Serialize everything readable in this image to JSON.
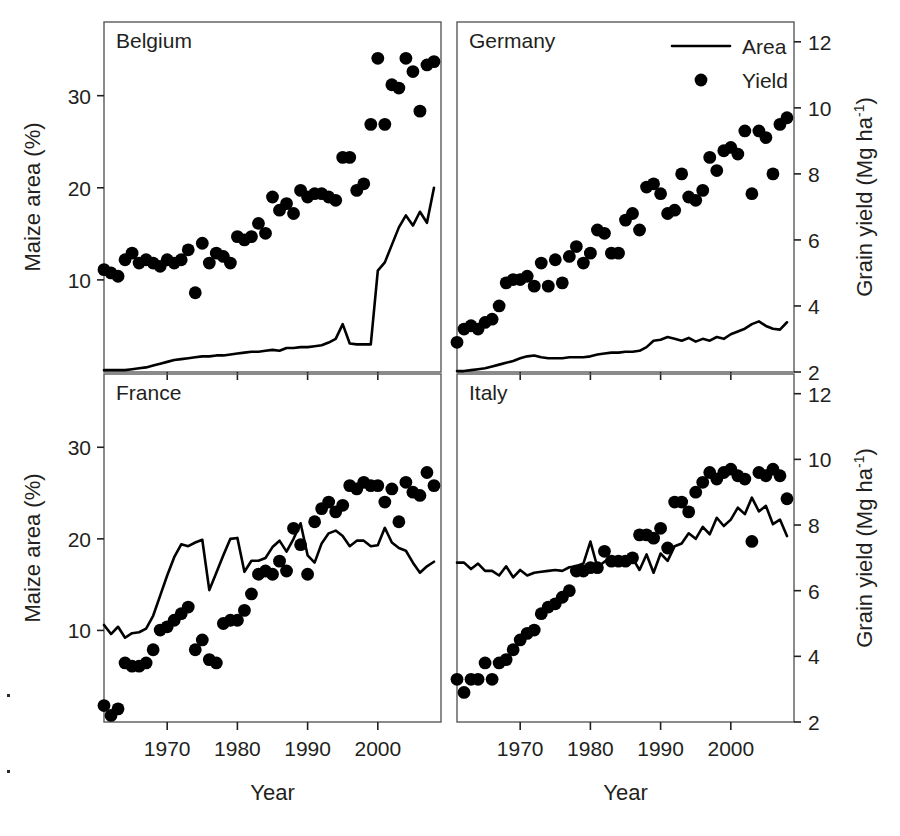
{
  "figure": {
    "left_axis_title": "Maize area (%)",
    "right_axis_title_main": "Grain yield (Mg ha",
    "right_axis_title_sup": "-1",
    "right_axis_title_close": ")",
    "x_axis_title": "Year",
    "legend": {
      "area_label": "Area",
      "yield_label": "Yield"
    },
    "ink_color": "#000000"
  },
  "chart_data": {
    "type": "line",
    "xlabel": "Year",
    "ylabel": "Maize area (%)",
    "y2label": "Grain yield (Mg ha-1)",
    "xlim": [
      1961,
      2009
    ],
    "ylim": [
      0,
      38
    ],
    "y2lim": [
      2,
      12.6
    ],
    "xticks": [
      1970,
      1980,
      1990,
      2000
    ],
    "yticks": [
      10,
      20,
      30
    ],
    "y2ticks": [
      2,
      4,
      6,
      8,
      10,
      12
    ],
    "grid": false,
    "legend_position": "top-right of Germany panel",
    "panels": [
      {
        "name": "Belgium",
        "position": "top-left",
        "show_left_axis": true,
        "show_right_axis": false,
        "show_x_labels": false,
        "series": [
          {
            "name": "Area",
            "type": "line",
            "axis": "left",
            "units": "%",
            "x": [
              1961,
              1962,
              1963,
              1964,
              1965,
              1966,
              1967,
              1968,
              1969,
              1970,
              1971,
              1972,
              1973,
              1974,
              1975,
              1976,
              1977,
              1978,
              1979,
              1980,
              1981,
              1982,
              1983,
              1984,
              1985,
              1986,
              1987,
              1988,
              1989,
              1990,
              1991,
              1992,
              1993,
              1994,
              1995,
              1996,
              1997,
              1998,
              1999,
              2000,
              2001,
              2002,
              2003,
              2004,
              2005,
              2006,
              2007,
              2008
            ],
            "values": [
              0.2,
              0.2,
              0.2,
              0.2,
              0.3,
              0.4,
              0.5,
              0.7,
              0.9,
              1.1,
              1.3,
              1.4,
              1.5,
              1.6,
              1.7,
              1.7,
              1.8,
              1.8,
              1.9,
              2.0,
              2.1,
              2.2,
              2.2,
              2.3,
              2.4,
              2.3,
              2.6,
              2.6,
              2.7,
              2.7,
              2.8,
              2.9,
              3.2,
              3.6,
              5.2,
              3.1,
              3.0,
              3.0,
              3.0,
              11.0,
              11.9,
              13.8,
              15.7,
              17.0,
              15.9,
              17.4,
              16.2,
              20.0
            ]
          },
          {
            "name": "Yield",
            "type": "scatter",
            "axis": "right",
            "units": "Mg ha-1",
            "x": [
              1961,
              1962,
              1963,
              1964,
              1965,
              1966,
              1967,
              1968,
              1969,
              1970,
              1971,
              1972,
              1973,
              1974,
              1975,
              1976,
              1977,
              1978,
              1979,
              1980,
              1981,
              1982,
              1983,
              1984,
              1985,
              1986,
              1987,
              1988,
              1989,
              1990,
              1991,
              1992,
              1993,
              1994,
              1995,
              1996,
              1997,
              1998,
              1999,
              2000,
              2001,
              2002,
              2003,
              2004,
              2005,
              2006,
              2007,
              2008
            ],
            "values": [
              5.1,
              5.0,
              4.9,
              5.4,
              5.6,
              5.3,
              5.4,
              5.3,
              5.2,
              5.4,
              5.3,
              5.4,
              5.7,
              4.4,
              5.9,
              5.3,
              5.6,
              5.5,
              5.3,
              6.1,
              6.0,
              6.1,
              6.5,
              6.2,
              7.3,
              6.9,
              7.1,
              6.8,
              7.5,
              7.3,
              7.4,
              7.4,
              7.3,
              7.2,
              8.5,
              8.5,
              7.5,
              7.7,
              9.5,
              11.5,
              9.5,
              10.7,
              10.6,
              11.5,
              11.1,
              9.9,
              11.3,
              11.4
            ]
          }
        ]
      },
      {
        "name": "Germany",
        "position": "top-right",
        "show_left_axis": false,
        "show_right_axis": true,
        "show_x_labels": false,
        "series": [
          {
            "name": "Area",
            "type": "line",
            "axis": "left",
            "units": "%",
            "x": [
              1961,
              1962,
              1963,
              1964,
              1965,
              1966,
              1967,
              1968,
              1969,
              1970,
              1971,
              1972,
              1973,
              1974,
              1975,
              1976,
              1977,
              1978,
              1979,
              1980,
              1981,
              1982,
              1983,
              1984,
              1985,
              1986,
              1987,
              1988,
              1989,
              1990,
              1991,
              1992,
              1993,
              1994,
              1995,
              1996,
              1997,
              1998,
              1999,
              2000,
              2001,
              2002,
              2003,
              2004,
              2005,
              2006,
              2007,
              2008
            ],
            "values": [
              0.1,
              0.1,
              0.2,
              0.3,
              0.4,
              0.6,
              0.8,
              1.0,
              1.2,
              1.5,
              1.7,
              1.8,
              1.6,
              1.5,
              1.5,
              1.5,
              1.6,
              1.6,
              1.6,
              1.7,
              1.9,
              2.0,
              2.1,
              2.1,
              2.2,
              2.2,
              2.3,
              2.7,
              3.4,
              3.5,
              3.8,
              3.6,
              3.4,
              3.7,
              3.3,
              3.6,
              3.4,
              3.8,
              3.6,
              4.1,
              4.4,
              4.7,
              5.2,
              5.5,
              5.0,
              4.7,
              4.6,
              5.4
            ]
          },
          {
            "name": "Yield",
            "type": "scatter",
            "axis": "right",
            "units": "Mg ha-1",
            "x": [
              1961,
              1962,
              1963,
              1964,
              1965,
              1966,
              1967,
              1968,
              1969,
              1970,
              1971,
              1972,
              1973,
              1974,
              1975,
              1976,
              1977,
              1978,
              1979,
              1980,
              1981,
              1982,
              1983,
              1984,
              1985,
              1986,
              1987,
              1988,
              1989,
              1990,
              1991,
              1992,
              1993,
              1994,
              1995,
              1996,
              1997,
              1998,
              1999,
              2000,
              2001,
              2002,
              2003,
              2004,
              2005,
              2006,
              2007,
              2008
            ],
            "values": [
              2.9,
              3.3,
              3.4,
              3.3,
              3.5,
              3.6,
              4.0,
              4.7,
              4.8,
              4.8,
              4.9,
              4.6,
              5.3,
              4.6,
              5.4,
              4.7,
              5.5,
              5.8,
              5.3,
              5.6,
              6.3,
              6.2,
              5.6,
              5.6,
              6.6,
              6.8,
              6.3,
              7.6,
              7.7,
              7.4,
              6.8,
              6.9,
              8.0,
              7.3,
              7.2,
              7.5,
              8.5,
              8.1,
              8.7,
              8.8,
              8.6,
              9.3,
              7.4,
              9.3,
              9.1,
              8.0,
              9.5,
              9.7
            ]
          }
        ]
      },
      {
        "name": "France",
        "position": "bottom-left",
        "show_left_axis": true,
        "show_right_axis": false,
        "show_x_labels": true,
        "series": [
          {
            "name": "Area",
            "type": "line",
            "axis": "left",
            "units": "%",
            "x": [
              1961,
              1962,
              1963,
              1964,
              1965,
              1966,
              1967,
              1968,
              1969,
              1970,
              1971,
              1972,
              1973,
              1974,
              1975,
              1976,
              1977,
              1978,
              1979,
              1980,
              1981,
              1982,
              1983,
              1984,
              1985,
              1986,
              1987,
              1988,
              1989,
              1990,
              1991,
              1992,
              1993,
              1994,
              1995,
              1996,
              1997,
              1998,
              1999,
              2000,
              2001,
              2002,
              2003,
              2004,
              2005,
              2006,
              2007,
              2008
            ],
            "values": [
              10.6,
              9.6,
              10.4,
              9.2,
              9.7,
              9.8,
              10.2,
              11.6,
              13.8,
              16.0,
              18.0,
              19.4,
              19.2,
              19.6,
              19.9,
              14.4,
              16.3,
              18.2,
              20.0,
              20.1,
              16.4,
              17.6,
              17.6,
              17.9,
              19.1,
              19.8,
              18.6,
              20.0,
              21.7,
              18.2,
              17.4,
              19.5,
              20.6,
              20.9,
              20.3,
              19.2,
              19.8,
              19.8,
              19.2,
              19.3,
              21.2,
              19.6,
              19.0,
              18.7,
              17.4,
              16.3,
              17.0,
              17.5
            ]
          },
          {
            "name": "Yield",
            "type": "scatter",
            "axis": "right",
            "units": "Mg ha-1",
            "x": [
              1961,
              1962,
              1963,
              1964,
              1965,
              1966,
              1967,
              1968,
              1969,
              1970,
              1971,
              1972,
              1973,
              1974,
              1975,
              1976,
              1977,
              1978,
              1979,
              1980,
              1981,
              1982,
              1983,
              1984,
              1985,
              1986,
              1987,
              1988,
              1989,
              1990,
              1991,
              1992,
              1993,
              1994,
              1995,
              1996,
              1997,
              1998,
              1999,
              2000,
              2001,
              2002,
              2003,
              2004,
              2005,
              2006,
              2007,
              2008
            ],
            "values": [
              2.5,
              2.2,
              2.4,
              3.8,
              3.7,
              3.7,
              3.8,
              4.2,
              4.8,
              4.9,
              5.1,
              5.3,
              5.5,
              4.2,
              4.5,
              3.9,
              3.8,
              5.0,
              5.1,
              5.1,
              5.4,
              5.9,
              6.5,
              6.6,
              6.5,
              6.9,
              6.6,
              7.9,
              7.4,
              6.5,
              8.1,
              8.5,
              8.7,
              8.4,
              8.6,
              9.2,
              9.1,
              9.3,
              9.2,
              9.2,
              8.7,
              9.1,
              8.1,
              9.3,
              9.0,
              8.9,
              9.6,
              9.2
            ]
          }
        ]
      },
      {
        "name": "Italy",
        "position": "bottom-right",
        "show_left_axis": false,
        "show_right_axis": true,
        "show_x_labels": true,
        "series": [
          {
            "name": "Area",
            "type": "line",
            "axis": "left",
            "units": "%",
            "x": [
              1961,
              1962,
              1963,
              1964,
              1965,
              1966,
              1967,
              1968,
              1969,
              1970,
              1971,
              1972,
              1973,
              1974,
              1975,
              1976,
              1977,
              1978,
              1979,
              1980,
              1981,
              1982,
              1983,
              1984,
              1985,
              1986,
              1987,
              1988,
              1989,
              1990,
              1991,
              1992,
              1993,
              1994,
              1995,
              1996,
              1997,
              1998,
              1999,
              2000,
              2001,
              2002,
              2003,
              2004,
              2005,
              2006,
              2007,
              2008
            ],
            "values": [
              17.4,
              17.4,
              16.7,
              17.3,
              16.5,
              16.5,
              16.0,
              17.0,
              15.8,
              16.6,
              16.0,
              16.3,
              16.4,
              16.5,
              16.6,
              16.5,
              16.9,
              17.0,
              17.3,
              19.7,
              16.9,
              17.5,
              17.9,
              18.0,
              17.7,
              17.9,
              16.6,
              18.3,
              16.3,
              18.4,
              17.6,
              19.2,
              19.5,
              20.6,
              20.0,
              21.3,
              20.5,
              22.3,
              21.4,
              22.1,
              23.4,
              22.7,
              24.5,
              23.0,
              23.6,
              21.6,
              22.1,
              20.3
            ]
          },
          {
            "name": "Yield",
            "type": "scatter",
            "axis": "right",
            "units": "Mg ha-1",
            "x": [
              1961,
              1962,
              1963,
              1964,
              1965,
              1966,
              1967,
              1968,
              1969,
              1970,
              1971,
              1972,
              1973,
              1974,
              1975,
              1976,
              1977,
              1978,
              1979,
              1980,
              1981,
              1982,
              1983,
              1984,
              1985,
              1986,
              1987,
              1988,
              1989,
              1990,
              1991,
              1992,
              1993,
              1994,
              1995,
              1996,
              1997,
              1998,
              1999,
              2000,
              2001,
              2002,
              2003,
              2004,
              2005,
              2006,
              2007,
              2008
            ],
            "values": [
              3.3,
              2.9,
              3.3,
              3.3,
              3.8,
              3.3,
              3.8,
              3.9,
              4.2,
              4.5,
              4.7,
              4.8,
              5.3,
              5.5,
              5.6,
              5.8,
              6.0,
              6.6,
              6.6,
              6.7,
              6.7,
              7.2,
              6.9,
              6.9,
              6.9,
              7.0,
              7.7,
              7.7,
              7.6,
              7.9,
              7.3,
              8.7,
              8.7,
              8.4,
              9.0,
              9.3,
              9.6,
              9.4,
              9.6,
              9.7,
              9.5,
              9.4,
              7.5,
              9.6,
              9.5,
              9.7,
              9.5,
              8.8
            ]
          }
        ]
      }
    ]
  }
}
